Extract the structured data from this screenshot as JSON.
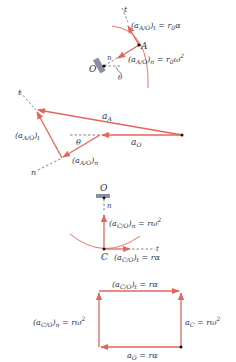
{
  "colors": {
    "vector": "#e4655a",
    "text": "#2a3550",
    "support": "#8a8fa3",
    "point": "#111111"
  },
  "figure1": {
    "title": "Pendulum/rigid-body point A about O",
    "labels": {
      "t_axis": "t",
      "n_axis": "n",
      "point_A": "A",
      "point_O": "O",
      "angle": "θ",
      "tangential": "(a",
      "tangential_sub": "A/O",
      "tangential_rest": ")",
      "tangential_sub2": "t",
      "tangential_eq": " = r",
      "tangential_sub3": "0",
      "tangential_end": "α",
      "normal": "(a",
      "normal_sub": "A/O",
      "normal_rest": ")",
      "normal_sub2": "n",
      "normal_eq": " = r",
      "normal_sub3": "0",
      "normal_end": "ω",
      "normal_sup": "2"
    }
  },
  "figure2": {
    "title": "Acceleration polygon for A",
    "labels": {
      "t_axis": "t",
      "n_axis": "n",
      "aA": "a",
      "aA_sub": "A",
      "aO": "a",
      "aO_sub": "O",
      "angle": "θ",
      "tangential": "(a",
      "tangential_sub": "A/O",
      "tangential_rest": ")",
      "tangential_sub2": "t",
      "normal": "(a",
      "normal_sub": "A/O",
      "normal_rest": ")",
      "normal_sub2": "n"
    }
  },
  "figure3": {
    "title": "Rolling wheel contact point C about O",
    "labels": {
      "point_O": "O",
      "point_C": "C",
      "n_axis": "n",
      "t_axis": "t",
      "normal": "(a",
      "normal_sub": "C/O",
      "normal_rest": ")",
      "normal_sub2": "n",
      "normal_eq": " = rω",
      "normal_sup": "2",
      "tangential": "(a",
      "tangential_sub": "C/O",
      "tangential_rest": ")",
      "tangential_sub2": "t",
      "tangential_eq": " = rα"
    }
  },
  "figure4": {
    "title": "Acceleration polygon for C",
    "labels": {
      "top": "(a",
      "top_sub": "C/O",
      "top_rest": ")",
      "top_sub2": "t",
      "top_eq": " = rα",
      "left": "(a",
      "left_sub": "C/O",
      "left_rest": ")",
      "left_sub2": "n",
      "left_eq": " = rω",
      "left_sup": "2",
      "right": "a",
      "right_sub": "C",
      "right_eq": " = rω",
      "right_sup": "2",
      "bottom": "a",
      "bottom_sub": "O",
      "bottom_eq": " = rα"
    }
  }
}
